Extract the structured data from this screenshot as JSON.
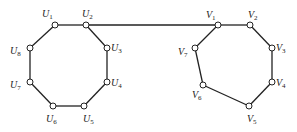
{
  "diagram": {
    "type": "graph",
    "colors": {
      "edge": "#222222",
      "node_fill": "#ffffff",
      "node_stroke": "#222222",
      "label": "#222222"
    },
    "nodes": [
      {
        "id": "U1",
        "letter": "U",
        "sub": "1",
        "x": 55,
        "y": 25,
        "lx": 42,
        "ly": 17
      },
      {
        "id": "U2",
        "letter": "U",
        "sub": "2",
        "x": 86,
        "y": 25,
        "lx": 82,
        "ly": 17
      },
      {
        "id": "U3",
        "letter": "U",
        "sub": "3",
        "x": 107,
        "y": 48,
        "lx": 111,
        "ly": 51
      },
      {
        "id": "U4",
        "letter": "U",
        "sub": "4",
        "x": 107,
        "y": 82,
        "lx": 111,
        "ly": 86
      },
      {
        "id": "U5",
        "letter": "U",
        "sub": "5",
        "x": 84,
        "y": 106,
        "lx": 83,
        "ly": 122
      },
      {
        "id": "U6",
        "letter": "U",
        "sub": "6",
        "x": 53,
        "y": 106,
        "lx": 46,
        "ly": 122
      },
      {
        "id": "U7",
        "letter": "U",
        "sub": "7",
        "x": 30,
        "y": 82,
        "lx": 10,
        "ly": 88
      },
      {
        "id": "U8",
        "letter": "U",
        "sub": "8",
        "x": 30,
        "y": 48,
        "lx": 10,
        "ly": 54
      },
      {
        "id": "V1",
        "letter": "V",
        "sub": "1",
        "x": 218,
        "y": 25,
        "lx": 206,
        "ly": 18
      },
      {
        "id": "V2",
        "letter": "V",
        "sub": "2",
        "x": 250,
        "y": 25,
        "lx": 248,
        "ly": 18
      },
      {
        "id": "V3",
        "letter": "V",
        "sub": "3",
        "x": 272,
        "y": 48,
        "lx": 276,
        "ly": 51
      },
      {
        "id": "V4",
        "letter": "V",
        "sub": "4",
        "x": 272,
        "y": 82,
        "lx": 276,
        "ly": 86
      },
      {
        "id": "V5",
        "letter": "V",
        "sub": "5",
        "x": 249,
        "y": 106,
        "lx": 247,
        "ly": 122
      },
      {
        "id": "V6",
        "letter": "V",
        "sub": "6",
        "x": 203,
        "y": 85,
        "lx": 192,
        "ly": 98
      },
      {
        "id": "V7",
        "letter": "V",
        "sub": "7",
        "x": 195,
        "y": 48,
        "lx": 178,
        "ly": 55
      }
    ],
    "edges": [
      [
        "U1",
        "U2"
      ],
      [
        "U2",
        "U3"
      ],
      [
        "U3",
        "U4"
      ],
      [
        "U4",
        "U5"
      ],
      [
        "U5",
        "U6"
      ],
      [
        "U6",
        "U7"
      ],
      [
        "U7",
        "U8"
      ],
      [
        "U8",
        "U1"
      ],
      [
        "U2",
        "V1"
      ],
      [
        "V1",
        "V2"
      ],
      [
        "V2",
        "V3"
      ],
      [
        "V3",
        "V4"
      ],
      [
        "V4",
        "V5"
      ],
      [
        "V5",
        "V6"
      ],
      [
        "V6",
        "V7"
      ],
      [
        "V7",
        "V1"
      ]
    ]
  }
}
